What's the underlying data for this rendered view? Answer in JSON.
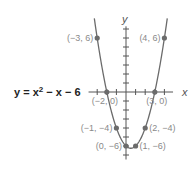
{
  "chart_data": {
    "type": "line",
    "title": "",
    "equation_label": "y = x² − x − 6",
    "equation_parts": {
      "lhs": "y = x",
      "exp": "2",
      "rhs": " − x − 6"
    },
    "xlabel": "x",
    "ylabel": "y",
    "xlim": [
      -4,
      5
    ],
    "ylim": [
      -7,
      7
    ],
    "grid": false,
    "series": [
      {
        "name": "y = x^2 - x - 6",
        "function": "x^2 - x - 6",
        "domain": [
          -3.3,
          4.3
        ]
      }
    ],
    "points": [
      {
        "x": -3,
        "y": 6,
        "label": "(−3, 6)",
        "anchor": "left"
      },
      {
        "x": 4,
        "y": 6,
        "label": "(4, 6)",
        "anchor": "left-of-point"
      },
      {
        "x": -2,
        "y": 0,
        "label": "(−2, 0)",
        "anchor": "below"
      },
      {
        "x": 3,
        "y": 0,
        "label": "(3, 0)",
        "anchor": "below"
      },
      {
        "x": -1,
        "y": -4,
        "label": "(−1, −4)",
        "anchor": "left"
      },
      {
        "x": 2,
        "y": -4,
        "label": "(2, −4)",
        "anchor": "right"
      },
      {
        "x": 0,
        "y": -6,
        "label": "(0, −6)",
        "anchor": "left"
      },
      {
        "x": 1,
        "y": -6,
        "label": "(1, −6)",
        "anchor": "right"
      }
    ],
    "colors": {
      "curve": "#6b6b6b",
      "points": "#6b6b6b",
      "axes": "#555555",
      "labels": "#8a8a8a"
    }
  }
}
